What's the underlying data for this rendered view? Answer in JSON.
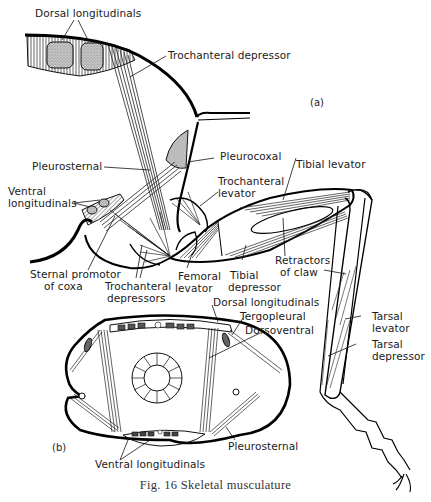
{
  "figure": {
    "caption": "Fig. 16   Skeletal musculature",
    "panels": {
      "a": {
        "tag": "(a)",
        "labels": {
          "dorsal_longitudinals": "Dorsal longitudinals",
          "trochanteral_depressor": "Trochanteral depressor",
          "pleurosternal": "Pleurosternal",
          "pleurocoxal": "Pleurocoxal",
          "tibial_levator": "Tibial levator",
          "ventral_longitudinals_1": "Ventral",
          "ventral_longitudinals_2": "longitudinals",
          "trochanteral_levator_1": "Trochanteral",
          "trochanteral_levator_2": "levator",
          "retractors_of_claw_1": "Retractors",
          "retractors_of_claw_2": "of claw",
          "sternal_promotor_1": "Sternal promotor",
          "sternal_promotor_2": "of coxa",
          "femoral_levator_1": "Femoral",
          "femoral_levator_2": "levator",
          "tibial_depressor_1": "Tibial",
          "tibial_depressor_2": "depressor",
          "trochanteral_depressors_1": "Trochanteral",
          "trochanteral_depressors_2": "depressors",
          "tarsal_levator_1": "Tarsal",
          "tarsal_levator_2": "levator",
          "tarsal_depressor_1": "Tarsal",
          "tarsal_depressor_2": "depressor"
        }
      },
      "b": {
        "tag": "(b)",
        "labels": {
          "dorsal_longitudinals": "Dorsal longitudinals",
          "tergopleural": "Tergopleural",
          "dorsoventral": "Dorsoventral",
          "pleurosternal": "Pleurosternal",
          "ventral_longitudinals": "Ventral longitudinals"
        }
      }
    }
  }
}
